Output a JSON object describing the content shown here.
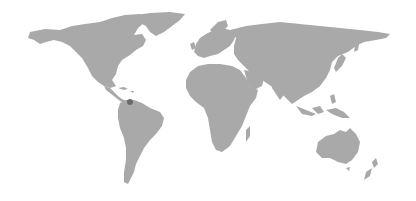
{
  "map": {
    "type": "world-map",
    "land_color": "#a9a9a9",
    "background_color": "#ffffff",
    "continents": [
      "north-america",
      "greenland",
      "south-america",
      "europe",
      "africa",
      "asia",
      "australia",
      "new-zealand"
    ],
    "markers": [
      {
        "label": "Venezuela",
        "x": 130,
        "y": 102,
        "radius": 3,
        "color": "#6b6b6b"
      }
    ]
  }
}
